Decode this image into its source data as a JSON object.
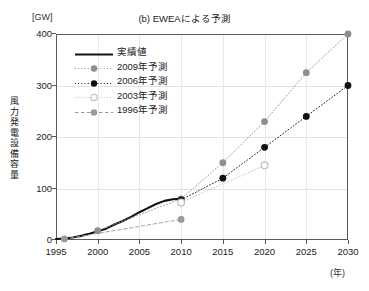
{
  "axis_unit_y": "[GW]",
  "axis_unit_x": "(年)",
  "ylabel": "風力発電設備容量",
  "chart_data": {
    "type": "line",
    "title": "(b) EWEAによる予測",
    "xlabel": "(年)",
    "ylabel": "風力発電設備容量",
    "y_unit": "[GW]",
    "xlim": [
      1995,
      2030
    ],
    "ylim": [
      0,
      400
    ],
    "xticks": [
      1995,
      2000,
      2005,
      2010,
      2015,
      2020,
      2025,
      2030
    ],
    "yticks": [
      0,
      100,
      200,
      300,
      400
    ],
    "grid": true,
    "legend_position": "upper-left",
    "series": [
      {
        "name": "実績値",
        "style": "solid-thick",
        "color": "#111111",
        "marker": "none",
        "x": [
          1995,
          1996,
          1997,
          1998,
          1999,
          2000,
          2001,
          2002,
          2003,
          2004,
          2005,
          2006,
          2007,
          2008,
          2009,
          2010
        ],
        "values": [
          2,
          3,
          5,
          8,
          12,
          17,
          22,
          30,
          37,
          45,
          54,
          62,
          70,
          76,
          79,
          80
        ]
      },
      {
        "name": "2009年予測",
        "style": "dotted",
        "color": "#8e8e8e",
        "marker": "filled-circle",
        "x": [
          2000,
          2010,
          2015,
          2020,
          2025,
          2030
        ],
        "values": [
          18,
          80,
          150,
          230,
          325,
          400
        ]
      },
      {
        "name": "2006年予測",
        "style": "dotted",
        "color": "#111111",
        "marker": "filled-circle",
        "x": [
          2010,
          2015,
          2020,
          2025,
          2030
        ],
        "values": [
          78,
          120,
          180,
          240,
          300
        ]
      },
      {
        "name": "2003年予測",
        "style": "dotted",
        "color": "#bcbcbc",
        "marker": "open-circle",
        "x": [
          2010,
          2020
        ],
        "values": [
          73,
          145
        ]
      },
      {
        "name": "1996年予測",
        "style": "dashed",
        "color": "#9a9a9a",
        "marker": "filled-circle",
        "x": [
          1996,
          2010
        ],
        "values": [
          2,
          40
        ]
      }
    ]
  },
  "legend": {
    "items": [
      {
        "label": "実績値"
      },
      {
        "label": "2009年予測"
      },
      {
        "label": "2006年予測"
      },
      {
        "label": "2003年予測"
      },
      {
        "label": "1996年予測"
      }
    ]
  }
}
